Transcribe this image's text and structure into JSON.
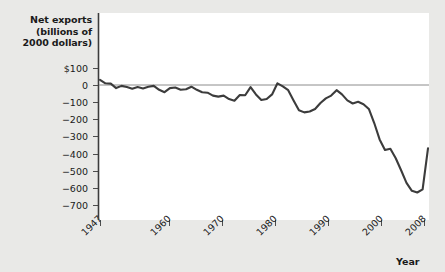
{
  "chart_data": {
    "type": "line",
    "title": "",
    "ylabel_lines": [
      "Net exports",
      "(billions of",
      "2000 dollars)"
    ],
    "xlabel": "Year",
    "ylim": [
      -750,
      130
    ],
    "xlim": [
      1947,
      2009
    ],
    "yticks": [
      100,
      0,
      -100,
      -200,
      -300,
      -400,
      -500,
      -600,
      -700
    ],
    "ytick_labels": [
      "$100",
      "0",
      "−100",
      "−200",
      "−300",
      "−400",
      "−500",
      "−600",
      "−700"
    ],
    "xticks": [
      1947,
      1960,
      1970,
      1980,
      1990,
      2000,
      2008
    ],
    "xtick_labels": [
      "1947",
      "1960",
      "1970",
      "1980",
      "1990",
      "2000",
      "2008"
    ],
    "grid": false,
    "legend": "none",
    "zero_line": true,
    "series_name": "Net exports",
    "line_color": "#3c3c3c",
    "plot_background": "#ffffff",
    "page_background": "#e9e9e7",
    "x": [
      1947,
      1948,
      1949,
      1950,
      1951,
      1952,
      1953,
      1954,
      1955,
      1956,
      1957,
      1958,
      1959,
      1960,
      1961,
      1962,
      1963,
      1964,
      1965,
      1966,
      1967,
      1968,
      1969,
      1970,
      1971,
      1972,
      1973,
      1974,
      1975,
      1976,
      1977,
      1978,
      1979,
      1980,
      1981,
      1982,
      1983,
      1984,
      1985,
      1986,
      1987,
      1988,
      1989,
      1990,
      1991,
      1992,
      1993,
      1994,
      1995,
      1996,
      1997,
      1998,
      1999,
      2000,
      2001,
      2002,
      2003,
      2004,
      2005,
      2006,
      2007,
      2008
    ],
    "values": [
      30,
      10,
      8,
      -18,
      -5,
      -12,
      -22,
      -12,
      -20,
      -10,
      -5,
      -28,
      -42,
      -18,
      -15,
      -28,
      -25,
      -10,
      -28,
      -42,
      -45,
      -62,
      -68,
      -62,
      -82,
      -92,
      -58,
      -60,
      -12,
      -55,
      -88,
      -82,
      -55,
      10,
      -8,
      -30,
      -90,
      -148,
      -160,
      -155,
      -140,
      -105,
      -78,
      -62,
      -30,
      -55,
      -90,
      -108,
      -98,
      -112,
      -140,
      -222,
      -318,
      -380,
      -372,
      -428,
      -498,
      -572,
      -618,
      -628,
      -610,
      -370
    ],
    "annotations": []
  },
  "axis": {
    "y_title": "Net exports (billions of 2000 dollars)",
    "x_title": "Year"
  }
}
